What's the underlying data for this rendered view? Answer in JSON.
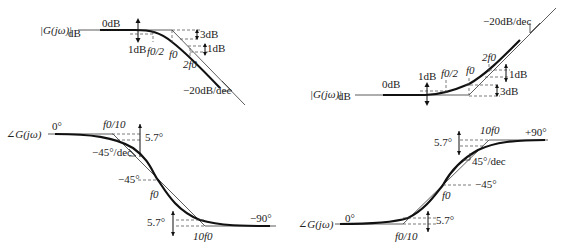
{
  "diagrams": {
    "lowpass_magnitude": {
      "axis_label": "|G(jω)|",
      "axis_sub": "dB",
      "zero_label": "0dB",
      "one_db_left": "1dB",
      "three_db": "3dB",
      "one_db_right": "1dB",
      "f0_half": "f0/2",
      "f0": "f0",
      "two_f0": "2f0",
      "slope": "−20dB/dec"
    },
    "highpass_magnitude": {
      "axis_label": "|G(jω)|",
      "axis_sub": "dB",
      "zero_label": "0dB",
      "one_db_left": "1dB",
      "f0_half": "f0/2",
      "f0": "f0",
      "two_f0": "2f0",
      "one_db_right": "1dB",
      "three_db": "3dB",
      "slope": "−20dB/dec"
    },
    "lowpass_phase": {
      "axis_label": "∠G(jω)",
      "zero_label": "0°",
      "f0_tenth": "f0/10",
      "top_deg": "5.7°",
      "slope": "−45°/dec",
      "mid_deg": "−45°",
      "f0": "f0",
      "bottom_deg": "5.7°",
      "ten_f0": "10f0",
      "end_label": "−90°"
    },
    "highpass_phase": {
      "axis_label": "∠G(jω)",
      "zero_label": "0°",
      "f0_tenth": "f0/10",
      "bottom_deg": "5.7°",
      "f0": "f0",
      "mid_deg": "−45°",
      "slope": "45°/dec",
      "top_deg": "5.7°",
      "ten_f0": "10f0",
      "end_label": "+90°"
    }
  }
}
